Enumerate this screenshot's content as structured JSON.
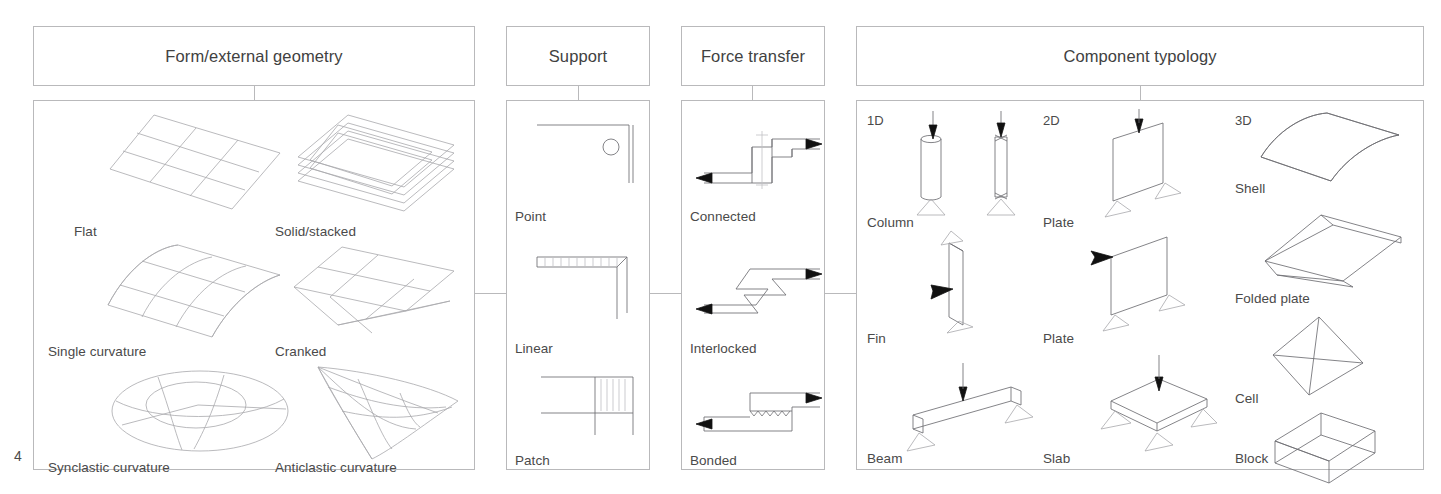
{
  "page": {
    "number": "4"
  },
  "columns": [
    {
      "id": "form",
      "header": "Form/external geometry",
      "items": [
        {
          "label": "Flat",
          "icon": "flat-grid-plane-icon"
        },
        {
          "label": "Solid/stacked",
          "icon": "stacked-layers-icon"
        },
        {
          "label": "Single curvature",
          "icon": "single-curvature-surface-icon"
        },
        {
          "label": "Cranked",
          "icon": "cranked-plane-icon"
        },
        {
          "label": "Synclastic curvature",
          "icon": "synclastic-dome-icon"
        },
        {
          "label": "Anticlastic curvature",
          "icon": "anticlastic-saddle-icon"
        }
      ]
    },
    {
      "id": "support",
      "header": "Support",
      "items": [
        {
          "label": "Point",
          "icon": "point-support-icon"
        },
        {
          "label": "Linear",
          "icon": "linear-support-icon"
        },
        {
          "label": "Patch",
          "icon": "patch-support-icon"
        }
      ]
    },
    {
      "id": "force",
      "header": "Force transfer",
      "items": [
        {
          "label": "Connected",
          "icon": "connected-joint-icon"
        },
        {
          "label": "Interlocked",
          "icon": "interlocked-joint-icon"
        },
        {
          "label": "Bonded",
          "icon": "bonded-joint-icon"
        }
      ]
    },
    {
      "id": "component",
      "header": "Component typology",
      "groups": [
        {
          "label": "1D",
          "items": [
            {
              "label": "Column",
              "icon": "column-icon"
            },
            {
              "label": "Fin",
              "icon": "fin-icon"
            },
            {
              "label": "Beam",
              "icon": "beam-icon"
            }
          ]
        },
        {
          "label": "2D",
          "items": [
            {
              "label": "Plate",
              "icon": "plate-vertical-icon"
            },
            {
              "label": "Plate",
              "icon": "plate-vertical-2-icon"
            },
            {
              "label": "Slab",
              "icon": "slab-icon"
            }
          ]
        },
        {
          "label": "3D",
          "items": [
            {
              "label": "Shell",
              "icon": "shell-icon"
            },
            {
              "label": "Folded plate",
              "icon": "folded-plate-icon"
            },
            {
              "label": "Cell",
              "icon": "cell-tetra-icon"
            },
            {
              "label": "Block",
              "icon": "block-box-icon"
            }
          ]
        }
      ]
    }
  ]
}
